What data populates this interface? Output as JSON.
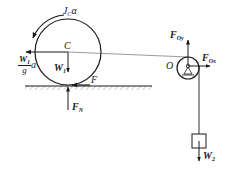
{
  "diagram": {
    "type": "free-body diagram",
    "colors": {
      "stroke": "#1a1a1a",
      "background": "#ffffff",
      "rope": "#555555"
    },
    "labels": {
      "inertia_moment": {
        "main": "J",
        "sub": "C",
        "tail": "α"
      },
      "center": "C",
      "inertia_force": {
        "num_main": "W",
        "num_sub": "1",
        "den": "g",
        "tail": "a"
      },
      "weight1": {
        "main": "W",
        "sub": "1"
      },
      "friction": "F",
      "normal": {
        "main": "F",
        "sub": "N"
      },
      "pulley_center": "O",
      "pulley_y": {
        "main": "F",
        "sub": "Oy"
      },
      "pulley_x": {
        "main": "F",
        "sub": "Ox"
      },
      "weight2": {
        "main": "W",
        "sub": "2"
      }
    },
    "elements": [
      "rolling disk with center C",
      "ground with hatching",
      "pulley O with pin support",
      "rope from C over pulley",
      "hanging block"
    ]
  }
}
